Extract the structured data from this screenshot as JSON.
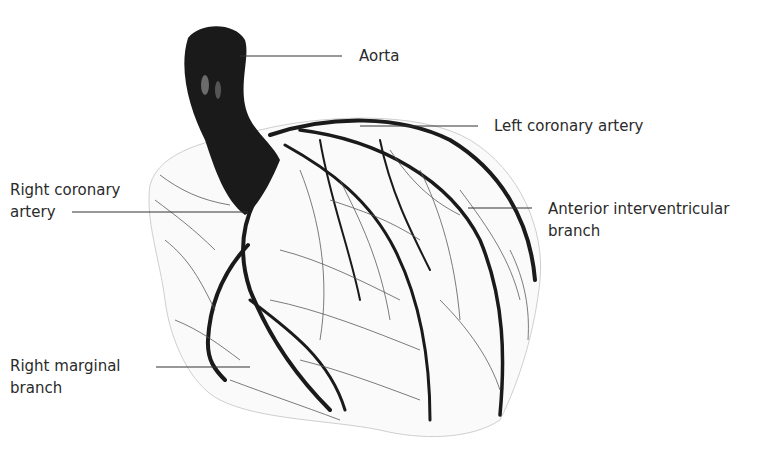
{
  "diagram": {
    "labels": {
      "aorta": "Aorta",
      "left_coronary": "Left coronary artery",
      "right_coronary_line1": "Right coronary",
      "right_coronary_line2": "artery",
      "anterior_line1": "Anterior interventricular",
      "anterior_line2": "branch",
      "marginal_line1": "Right marginal",
      "marginal_line2": "branch"
    },
    "colors": {
      "vessel": "#1a1a1a",
      "fine_vessel": "#555555",
      "leader_line": "#333333",
      "text": "#2b2b2b"
    }
  }
}
